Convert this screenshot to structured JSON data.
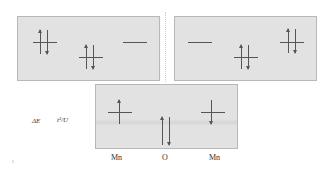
{
  "panels": {
    "top_left": {
      "sites": [
        {
          "name": "Mn",
          "electrons": [
            "up",
            "down"
          ]
        },
        {
          "name": "O",
          "electrons": [
            "up",
            "down"
          ]
        },
        {
          "name": "Mn",
          "electrons": []
        }
      ]
    },
    "top_right": {
      "sites": [
        {
          "name": "Mn",
          "electrons": []
        },
        {
          "name": "O",
          "electrons": [
            "up",
            "down"
          ]
        },
        {
          "name": "Mn",
          "electrons": [
            "up",
            "down"
          ]
        }
      ]
    },
    "bottom": {
      "sites": [
        {
          "name": "Mn",
          "electrons": [
            "up"
          ]
        },
        {
          "name": "O",
          "electrons": [
            "up",
            "down"
          ]
        },
        {
          "name": "Mn",
          "electrons": [
            "down"
          ]
        }
      ]
    }
  },
  "energy_label": "ΔE",
  "energy_expression": "t²/U",
  "site_labels": [
    "Mn",
    "O",
    "Mn"
  ],
  "corner_mark": "ı",
  "colors": {
    "panel_bg": "#e2e2e2",
    "panel_border": "#b8b8b8",
    "line": "#555555"
  }
}
